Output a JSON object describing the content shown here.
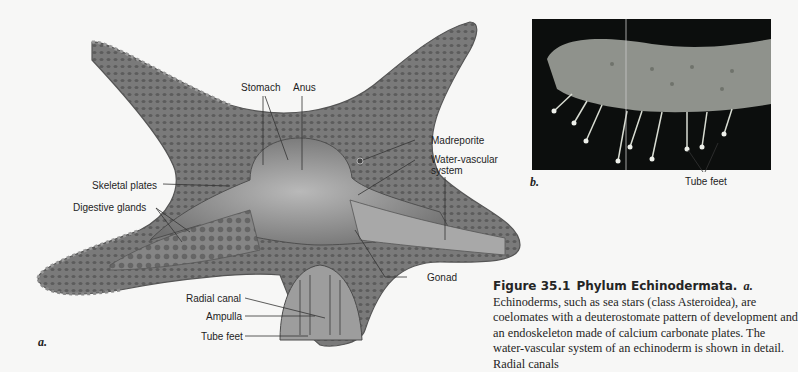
{
  "figure": {
    "panel_a_letter": "a.",
    "panel_b_letter": "b.",
    "labels_a": {
      "stomach": "Stomach",
      "anus": "Anus",
      "madreporite": "Madreporite",
      "water_vascular_line1": "Water-vascular",
      "water_vascular_line2": "system",
      "skeletal_plates": "Skeletal plates",
      "digestive_glands": "Digestive glands",
      "gonad": "Gonad",
      "radial_canal": "Radial canal",
      "ampulla": "Ampulla",
      "tube_feet": "Tube feet"
    },
    "labels_b": {
      "tube_feet": "Tube feet"
    },
    "colors": {
      "star_fill": "#7e7e7e",
      "star_dark": "#5a5a5a",
      "interior": "#9a9a9a",
      "photo_bg": "#0c0e0d",
      "photo_arm": "#8f928c"
    }
  },
  "caption": {
    "figure_number": "Figure 35.1",
    "title": "Phylum Echinodermata.",
    "panel_ref": "a.",
    "text": "Echinoderms, such as sea stars (class Asteroidea), are coelomates with a deuterostomate pattern of development and an endoskeleton made of calcium carbonate plates. The water-vascular system of an echinoderm is shown in detail. Radial canals"
  }
}
